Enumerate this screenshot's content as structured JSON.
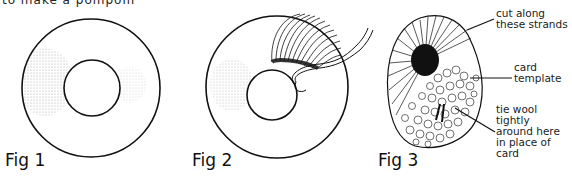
{
  "header": {
    "cut_off_text": "to make a pompom"
  },
  "figures": [
    {
      "id": "fig1",
      "label": "Fig 1",
      "description": "card ring template"
    },
    {
      "id": "fig2",
      "label": "Fig 2",
      "description": "winding wool around card ring"
    },
    {
      "id": "fig3",
      "label": "Fig 3",
      "description": "wound pompom with card template"
    }
  ],
  "annotations": {
    "cut": {
      "lines": [
        "cut along",
        "these strands"
      ]
    },
    "card": {
      "lines": [
        "card",
        "template"
      ]
    },
    "tie": {
      "lines": [
        "tie wool",
        "tightly",
        "around here",
        "in place of",
        "card"
      ]
    }
  },
  "colors": {
    "ink": "#111111",
    "background": "#ffffff"
  }
}
